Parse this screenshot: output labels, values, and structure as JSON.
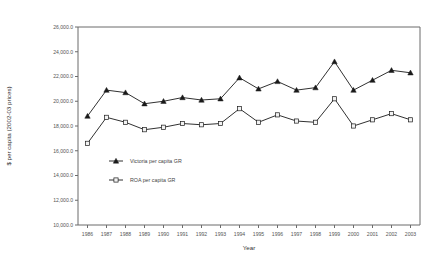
{
  "chart_data": {
    "type": "line",
    "title": "",
    "xlabel": "Year",
    "ylabel": "$ per capita (2002-03 prices)",
    "categories": [
      "1986",
      "1987",
      "1988",
      "1989",
      "1990",
      "1991",
      "1992",
      "1993",
      "1994",
      "1995",
      "1996",
      "1997",
      "1998",
      "1999",
      "2000",
      "2001",
      "2002",
      "2003"
    ],
    "ylim": [
      10000,
      26000
    ],
    "ytick_labels": [
      "26,000.0",
      "24,000.0",
      "22,000.0",
      "20,000.0",
      "18,000.0",
      "16,000.0",
      "14,000.0",
      "12,000.0",
      "10,000.0"
    ],
    "ytick_values": [
      26000,
      24000,
      22000,
      20000,
      18000,
      16000,
      14000,
      12000,
      10000
    ],
    "grid": false,
    "legend_position": "inside-left-lower",
    "series": [
      {
        "name": "Victoria per capita GR",
        "marker": "triangle-filled",
        "values": [
          18800,
          20900,
          20700,
          19800,
          20000,
          20300,
          20100,
          20200,
          21900,
          21000,
          21600,
          20900,
          21100,
          23200,
          20900,
          21700,
          22500,
          22300
        ]
      },
      {
        "name": "ROA per capita GR",
        "marker": "square-open",
        "values": [
          16600,
          18700,
          18300,
          17700,
          17900,
          18200,
          18100,
          18200,
          19400,
          18300,
          18900,
          18400,
          18300,
          20200,
          18000,
          18500,
          19000,
          18500
        ]
      }
    ]
  },
  "legend": {
    "entries": [
      {
        "label": "Victoria per capita GR"
      },
      {
        "label": "ROA per capita GR"
      }
    ]
  }
}
